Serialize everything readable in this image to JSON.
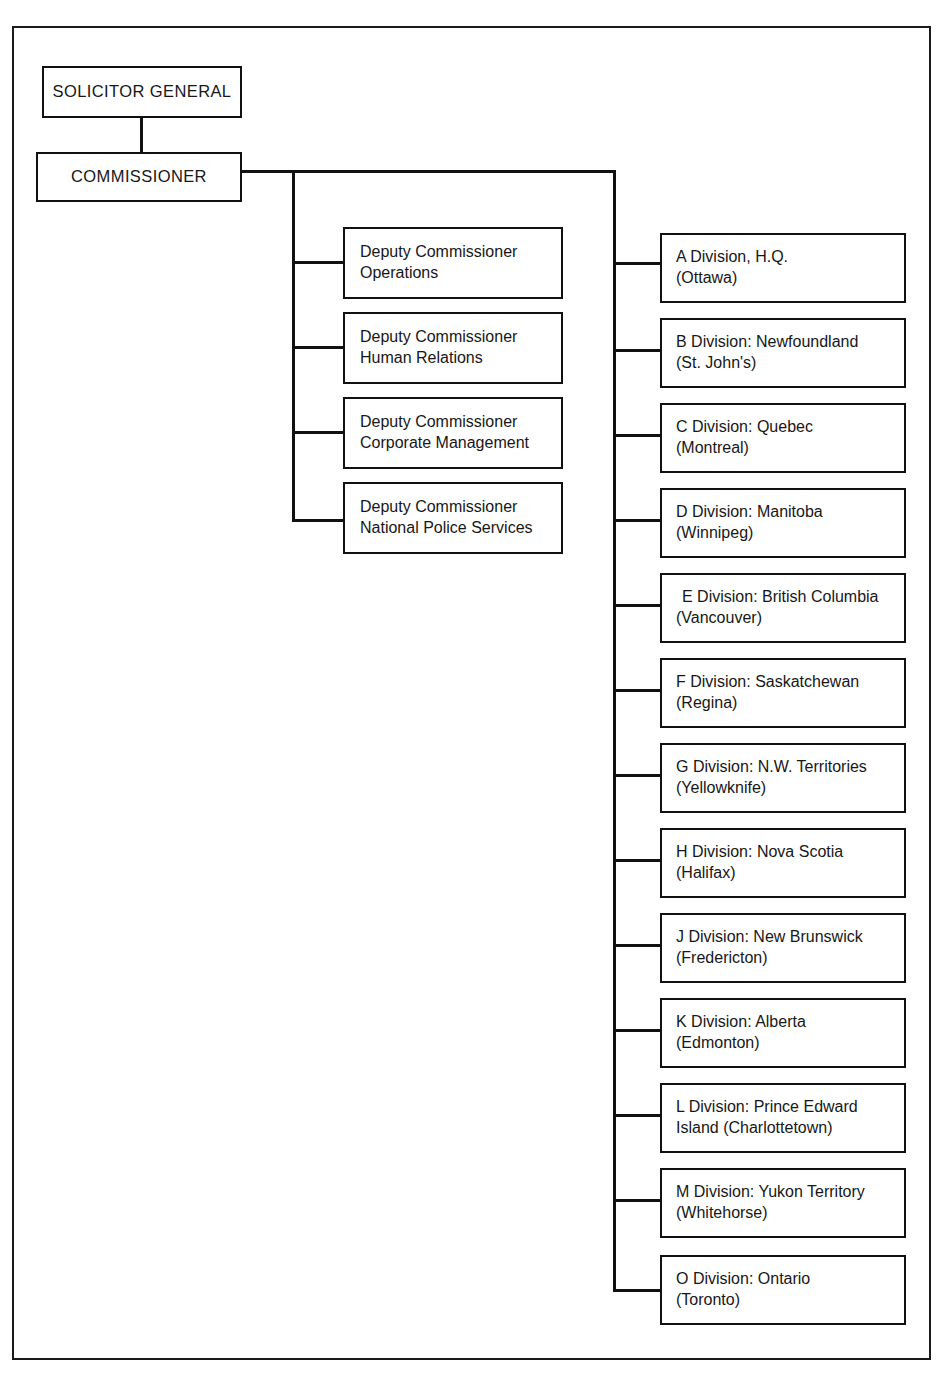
{
  "chart": {
    "type": "organization-chart",
    "root": {
      "label": "SOLICITOR GENERAL"
    },
    "head": {
      "label": "COMMISSIONER"
    },
    "deputy_commissioners": [
      {
        "line1": "Deputy Commissioner",
        "line2": "Operations"
      },
      {
        "line1": "Deputy Commissioner",
        "line2": "Human Relations"
      },
      {
        "line1": "Deputy Commissioner",
        "line2": "Corporate Management"
      },
      {
        "line1": "Deputy Commissioner",
        "line2": "National Police Services"
      }
    ],
    "divisions": [
      {
        "line1": "A Division, H.Q.",
        "line2": "(Ottawa)",
        "code": "A",
        "region": "H.Q.",
        "city": "Ottawa"
      },
      {
        "line1": "B Division: Newfoundland",
        "line2": "(St. John's)",
        "code": "B",
        "region": "Newfoundland",
        "city": "St. John's"
      },
      {
        "line1": "C Division: Quebec",
        "line2": "(Montreal)",
        "code": "C",
        "region": "Quebec",
        "city": "Montreal"
      },
      {
        "line1": "D Division: Manitoba",
        "line2": "(Winnipeg)",
        "code": "D",
        "region": "Manitoba",
        "city": "Winnipeg"
      },
      {
        "line1": "E Division: British Columbia",
        "line2": "(Vancouver)",
        "code": "E",
        "region": "British Columbia",
        "city": "Vancouver"
      },
      {
        "line1": "F Division: Saskatchewan",
        "line2": "(Regina)",
        "code": "F",
        "region": "Saskatchewan",
        "city": "Regina"
      },
      {
        "line1": "G Division: N.W. Territories",
        "line2": "(Yellowknife)",
        "code": "G",
        "region": "N.W. Territories",
        "city": "Yellowknife"
      },
      {
        "line1": "H Division: Nova Scotia",
        "line2": "(Halifax)",
        "code": "H",
        "region": "Nova Scotia",
        "city": "Halifax"
      },
      {
        "line1": "J Division: New Brunswick",
        "line2": "(Fredericton)",
        "code": "J",
        "region": "New Brunswick",
        "city": "Fredericton"
      },
      {
        "line1": "K Division: Alberta",
        "line2": "(Edmonton)",
        "code": "K",
        "region": "Alberta",
        "city": "Edmonton"
      },
      {
        "line1": "L Division: Prince Edward",
        "line2": "Island (Charlottetown)",
        "code": "L",
        "region": "Prince Edward Island",
        "city": "Charlottetown"
      },
      {
        "line1": "M Division: Yukon Territory",
        "line2": "(Whitehorse)",
        "code": "M",
        "region": "Yukon Territory",
        "city": "Whitehorse"
      },
      {
        "line1": "O Division: Ontario",
        "line2": "(Toronto)",
        "code": "O",
        "region": "Ontario",
        "city": "Toronto"
      }
    ],
    "colors": {
      "ink": "#111111",
      "paper": "#ffffff",
      "frame": "#1b1b1b"
    }
  }
}
